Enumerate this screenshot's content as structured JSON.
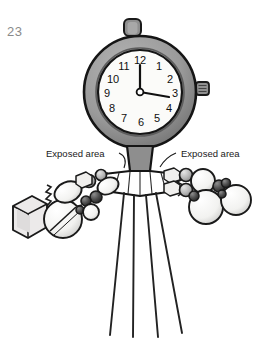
{
  "figure": {
    "number": "23",
    "background_color": "#ffffff",
    "width": 260,
    "height": 351
  },
  "callouts": {
    "left": {
      "text": "Exposed area"
    },
    "right": {
      "text": "Exposed area"
    }
  },
  "clock": {
    "time_shown": "3:00",
    "face_color": "#fbfbf9",
    "bezel_color": "#9a9a9a",
    "bezel_dark": "#6f6f6f",
    "outline_color": "#1a1a1a",
    "numerals": [
      {
        "value": "12",
        "x": 140,
        "y": 64
      },
      {
        "value": "1",
        "x": 158,
        "y": 69
      },
      {
        "value": "2",
        "x": 170,
        "y": 80
      },
      {
        "value": "3",
        "x": 174,
        "y": 95
      },
      {
        "value": "4",
        "x": 168,
        "y": 110
      },
      {
        "value": "5",
        "x": 156,
        "y": 119
      },
      {
        "value": "6",
        "x": 140,
        "y": 123
      },
      {
        "value": "7",
        "x": 124,
        "y": 119
      },
      {
        "value": "8",
        "x": 112,
        "y": 110
      },
      {
        "value": "9",
        "x": 107,
        "y": 95
      },
      {
        "value": "10",
        "x": 112,
        "y": 80
      },
      {
        "value": "11",
        "x": 124,
        "y": 69
      }
    ]
  },
  "structure": {
    "stem_color": "#8e8e8e",
    "skirt_color": "#ffffff",
    "ray_count": 4,
    "ray_color": "#222222"
  },
  "clusters": {
    "left": {
      "sphere_light": "#f4f4f2",
      "sphere_mid": "#b8b8b8",
      "sphere_dark": "#4a4a4a",
      "cube_color": "#e8e8e6"
    },
    "right": {
      "sphere_light": "#f4f4f2",
      "sphere_mid": "#b8b8b8",
      "sphere_dark": "#3c3c3c",
      "cube_color": "#efefed"
    }
  }
}
